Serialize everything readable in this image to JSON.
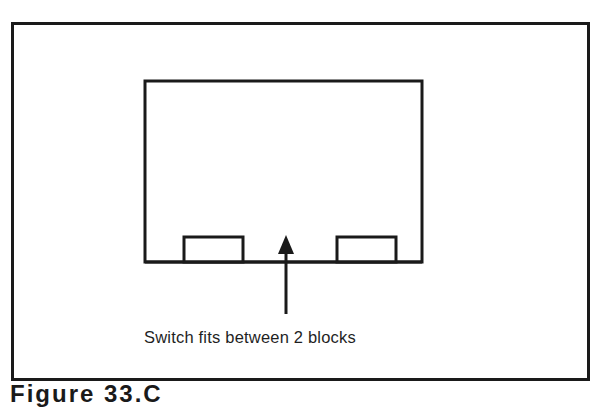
{
  "diagram": {
    "label": "Switch fits between 2 blocks",
    "caption": "Figure 33.C",
    "colors": {
      "line": "#1a1a1a",
      "background": "#ffffff"
    },
    "shapes": {
      "outer_frame": {
        "x": 11,
        "y": 22,
        "w": 576,
        "h": 356
      },
      "enclosure": {
        "x": 144,
        "y": 80,
        "w": 279,
        "h": 183
      },
      "left_block": {
        "x": 183,
        "y": 236,
        "w": 61,
        "h": 27
      },
      "right_block": {
        "x": 336,
        "y": 236,
        "w": 61,
        "h": 27
      },
      "arrow": {
        "x": 286,
        "tip_y": 236,
        "tail_y": 314
      }
    }
  }
}
